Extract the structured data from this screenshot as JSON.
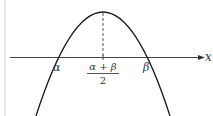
{
  "diagram": {
    "type": "downward parabola",
    "axis_label": "x",
    "roots": [
      {
        "name": "alpha",
        "label": "α"
      },
      {
        "name": "beta",
        "label": "β"
      }
    ],
    "vertex_label": {
      "numerator": "α + β",
      "denominator": "2"
    },
    "colors": {
      "curve": "#1a1a1a",
      "axis": "#444444",
      "dashed": "#555555",
      "border": "#cccccc"
    }
  }
}
